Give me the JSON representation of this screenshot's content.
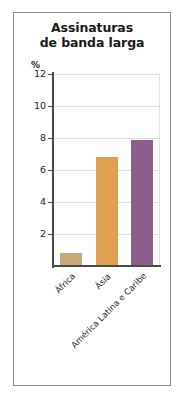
{
  "chart_data": {
    "type": "bar",
    "title": "Assinaturas de banda larga",
    "title_lines": [
      "Assinaturas",
      "de banda larga"
    ],
    "xlabel": "",
    "ylabel": "%",
    "unit": "%",
    "categories": [
      "África",
      "Ásia",
      "América Latina e Caribe"
    ],
    "values": [
      0.8,
      6.8,
      7.9
    ],
    "ylim": [
      0,
      12
    ],
    "yticks": [
      2,
      4,
      6,
      8,
      10,
      12
    ],
    "ytick_labels": [
      "2",
      "4",
      "6",
      "8",
      "10",
      "12"
    ],
    "grid": true,
    "legend": "none",
    "bar_colors": [
      "#c9a878",
      "#e0a051",
      "#8b5e8c"
    ],
    "series": [
      {
        "name": "Assinaturas de banda larga",
        "values": [
          0.8,
          6.8,
          7.9
        ]
      }
    ]
  },
  "colors": {
    "africa_bar": "#c9a878",
    "asia_bar": "#e0a051",
    "latin_america_bar": "#8b5e8c",
    "axis": "#4a4a4a",
    "grid": "#dcdcdc",
    "frame": "#8c8c8c",
    "text": "#1a1a1a"
  }
}
